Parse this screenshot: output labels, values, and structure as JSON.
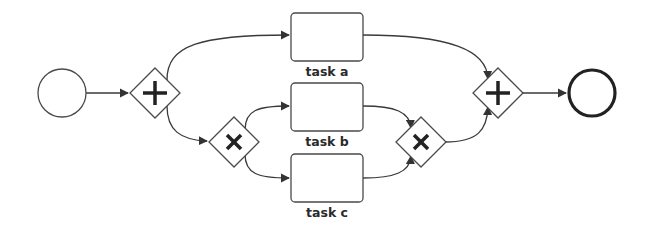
{
  "diagram": {
    "type": "BPMN process",
    "colors": {
      "stroke": "#4a4a4a",
      "edge": "#3a3a3a",
      "text": "#2a2a2a",
      "background": "#ffffff"
    },
    "nodes": [
      {
        "id": "start",
        "kind": "start-event",
        "label": ""
      },
      {
        "id": "and_split",
        "kind": "parallel-gateway",
        "symbol": "+",
        "label": ""
      },
      {
        "id": "xor_split",
        "kind": "exclusive-gateway",
        "symbol": "×",
        "label": ""
      },
      {
        "id": "task_a",
        "kind": "task",
        "label": "task a"
      },
      {
        "id": "task_b",
        "kind": "task",
        "label": "task b"
      },
      {
        "id": "task_c",
        "kind": "task",
        "label": "task c"
      },
      {
        "id": "xor_join",
        "kind": "exclusive-gateway",
        "symbol": "×",
        "label": ""
      },
      {
        "id": "and_join",
        "kind": "parallel-gateway",
        "symbol": "+",
        "label": ""
      },
      {
        "id": "end",
        "kind": "end-event",
        "label": ""
      }
    ],
    "edges": [
      {
        "from": "start",
        "to": "and_split"
      },
      {
        "from": "and_split",
        "to": "task_a"
      },
      {
        "from": "and_split",
        "to": "xor_split"
      },
      {
        "from": "xor_split",
        "to": "task_b"
      },
      {
        "from": "xor_split",
        "to": "task_c"
      },
      {
        "from": "task_b",
        "to": "xor_join"
      },
      {
        "from": "task_c",
        "to": "xor_join"
      },
      {
        "from": "task_a",
        "to": "and_join"
      },
      {
        "from": "xor_join",
        "to": "and_join"
      },
      {
        "from": "and_join",
        "to": "end"
      }
    ],
    "labels": {
      "task_a": "task a",
      "task_b": "task b",
      "task_c": "task c"
    }
  }
}
